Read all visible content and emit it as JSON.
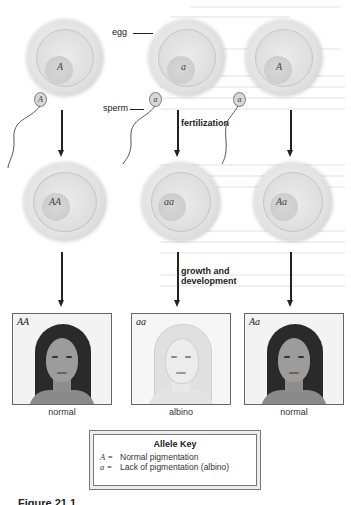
{
  "figure": {
    "columns": [
      {
        "egg_allele": "A",
        "sperm_allele": "A",
        "zygote_genotype": "AA",
        "portrait_genotype": "AA",
        "phenotype": "normal",
        "portrait_style": "normal"
      },
      {
        "egg_allele": "a",
        "sperm_allele": "a",
        "zygote_genotype": "aa",
        "portrait_genotype": "aa",
        "phenotype": "albino",
        "portrait_style": "albino"
      },
      {
        "egg_allele": "A",
        "sperm_allele": "a",
        "zygote_genotype": "Aa",
        "portrait_genotype": "Aa",
        "phenotype": "normal",
        "portrait_style": "normal"
      }
    ],
    "labels": {
      "egg": "egg",
      "sperm": "sperm",
      "fertilization": "fertilization",
      "growth_line1": "growth and",
      "growth_line2": "development"
    },
    "allele_key": {
      "title": "Allele Key",
      "entries": [
        {
          "symbol": "A =",
          "meaning": "Normal pigmentation"
        },
        {
          "symbol": "a =",
          "meaning": "Lack of pigmentation (albino)"
        }
      ]
    },
    "caption_fragment": "Figure 21.1"
  },
  "colors": {
    "line": "#222222",
    "cell_light": "#f4f4f4",
    "cell_dark": "#c8c8c8",
    "hair_normal": "#2a2a2a",
    "skin_normal": "#9a9a9a",
    "hair_albino": "#dedede",
    "skin_albino": "#e8e8e8"
  }
}
